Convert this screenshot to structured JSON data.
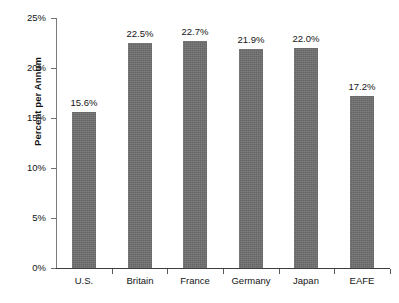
{
  "chart_data": {
    "type": "bar",
    "title": "",
    "subtitle": "",
    "xlabel": "",
    "ylabel": "Percent per Annum",
    "categories": [
      "U.S.",
      "Britain",
      "France",
      "Germany",
      "Japan",
      "EAFE"
    ],
    "values": [
      15.6,
      22.5,
      22.7,
      21.9,
      22.0,
      17.2
    ],
    "data_labels": [
      "15.6%",
      "22.5%",
      "22.7%",
      "21.9%",
      "22.0%",
      "17.2%"
    ],
    "ylim": [
      0,
      25
    ],
    "ytick_values": [
      0,
      5,
      10,
      15,
      20,
      25
    ],
    "ytick_labels": [
      "0%",
      "5%",
      "10%",
      "15%",
      "20%",
      "25%"
    ],
    "grid": false,
    "legend": null,
    "series": [
      {
        "name": "Percent per Annum",
        "color": "#6e6e6e",
        "values": [
          15.6,
          22.5,
          22.7,
          21.9,
          22.0,
          17.2
        ]
      }
    ],
    "colors": {
      "bar": "#6e6e6e",
      "axis": "#3d3d3d",
      "text": "#141414",
      "background": "#ffffff"
    }
  }
}
